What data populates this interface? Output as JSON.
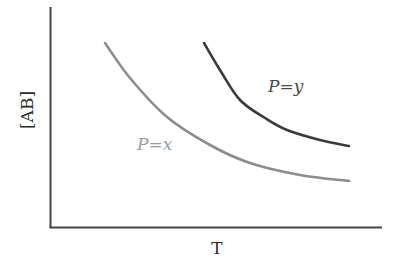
{
  "chart_data": {
    "type": "line",
    "title": "",
    "xlabel": "T",
    "ylabel": "[AB]",
    "grid": false,
    "legend": "inline labels",
    "axis_ticks": false,
    "series": [
      {
        "name": "P=x",
        "label_display": "P=x",
        "color": "#8c8c8c",
        "description": "Lower curve, decreasing with T",
        "points_px": [
          [
            105,
            43
          ],
          [
            130,
            78
          ],
          [
            167,
            117
          ],
          [
            210,
            145
          ],
          [
            250,
            163
          ],
          [
            300,
            175
          ],
          [
            349,
            181
          ]
        ]
      },
      {
        "name": "P=y",
        "label_display": "P=y",
        "color": "#3a3a3a",
        "description": "Upper curve, decreasing with T",
        "points_px": [
          [
            204,
            43
          ],
          [
            220,
            70
          ],
          [
            240,
            100
          ],
          [
            265,
            118
          ],
          [
            287,
            130
          ],
          [
            320,
            140
          ],
          [
            349,
            146
          ]
        ]
      }
    ]
  },
  "axes": {
    "color": "#444444",
    "x_label": "T",
    "y_label": "[AB]"
  },
  "labels": {
    "curve_x": "P=x",
    "curve_y": "P=y"
  }
}
